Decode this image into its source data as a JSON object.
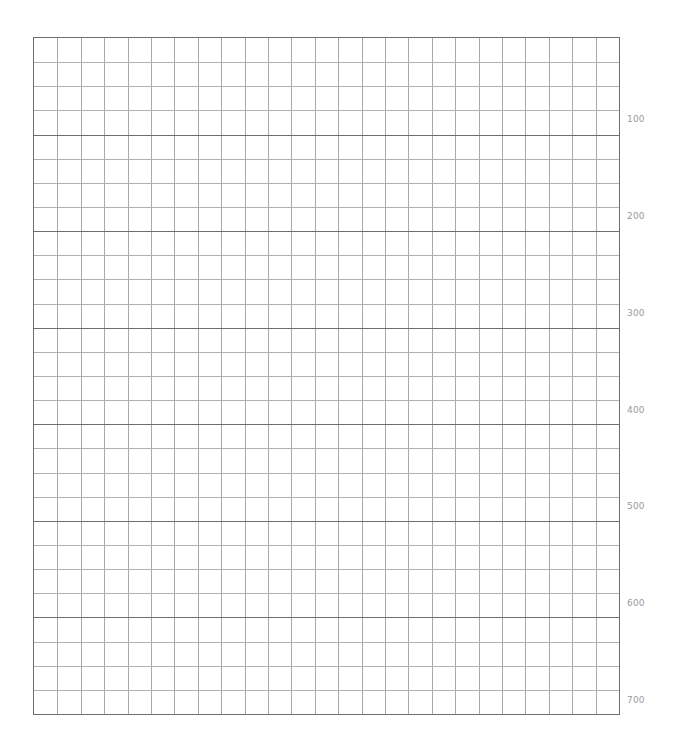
{
  "grid": {
    "columns": 25,
    "rows": 28,
    "major_every_rows": 4,
    "line_color": "#a8a8a8",
    "major_line_color": "#6e6e6e",
    "label_color": "#9a9a9a"
  },
  "labels": [
    {
      "text": "100",
      "y": 114
    },
    {
      "text": "200",
      "y": 211
    },
    {
      "text": "300",
      "y": 308
    },
    {
      "text": "400",
      "y": 405
    },
    {
      "text": "500",
      "y": 501
    },
    {
      "text": "600",
      "y": 598
    },
    {
      "text": "700",
      "y": 695
    }
  ]
}
